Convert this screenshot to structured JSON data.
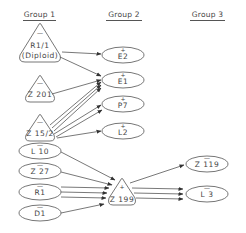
{
  "headers": {
    "group1": "Group 1",
    "group2": "Group 2",
    "group3": "Group 3"
  },
  "nodes": {
    "R1_1": {
      "label": "R1/1",
      "sublabel": "(Diploid)",
      "sign": "—",
      "shape": "triangle"
    },
    "Z201": {
      "label": "Z 201",
      "sign": "—",
      "shape": "triangle"
    },
    "Z15_2": {
      "label": "Z 15/2",
      "sign": "—",
      "shape": "triangle"
    },
    "L10": {
      "label": "L 10",
      "sign": "—",
      "shape": "ellipse"
    },
    "Z27": {
      "label": "Z 27",
      "sign": "—",
      "shape": "ellipse"
    },
    "R1": {
      "label": "R1",
      "sign": "—",
      "shape": "ellipse"
    },
    "D1": {
      "label": "D1",
      "sign": "—",
      "shape": "ellipse"
    },
    "E2": {
      "label": "E2",
      "sign": "+",
      "shape": "ellipse"
    },
    "E1": {
      "label": "E1",
      "sign": "+",
      "shape": "ellipse"
    },
    "P7": {
      "label": "P7",
      "sign": "+",
      "shape": "ellipse"
    },
    "L2": {
      "label": "L2",
      "sign": "+",
      "shape": "ellipse"
    },
    "Z199": {
      "label": "Z 199",
      "sign": "+",
      "shape": "triangle"
    },
    "Z119": {
      "label": "Z 119",
      "sign": "—",
      "shape": "ellipse"
    },
    "L3": {
      "label": "L 3",
      "sign": "—",
      "shape": "ellipse"
    }
  },
  "edges": [
    {
      "from": "R1/1",
      "to": "E2"
    },
    {
      "from": "R1/1",
      "to": "E1"
    },
    {
      "from": "Z 201",
      "to": "E1"
    },
    {
      "from": "Z 15/2",
      "to": "E1",
      "count": 3
    },
    {
      "from": "Z 15/2",
      "to": "P7",
      "count": 2
    },
    {
      "from": "Z 15/2",
      "to": "L2"
    },
    {
      "from": "L 10",
      "to": "Z 199"
    },
    {
      "from": "Z 27",
      "to": "Z 199"
    },
    {
      "from": "R1",
      "to": "Z 199",
      "count": 3
    },
    {
      "from": "D1",
      "to": "Z 199"
    },
    {
      "from": "Z 199",
      "to": "Z 119"
    },
    {
      "from": "Z 199",
      "to": "L 3",
      "count": 3
    }
  ],
  "colors": {
    "stroke": "#555555",
    "text": "#444444",
    "background": "#ffffff"
  }
}
